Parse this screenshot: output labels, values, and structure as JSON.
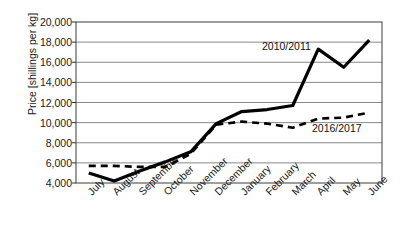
{
  "chart_data": {
    "type": "line",
    "title": "",
    "xlabel": "",
    "ylabel": "Price [shillings per kg]",
    "ylim": [
      4000,
      20000
    ],
    "ytick_values": [
      4000,
      6000,
      8000,
      10000,
      12000,
      14000,
      16000,
      18000,
      20000
    ],
    "ytick_labels": [
      "4,000",
      "6,000",
      "8,000",
      "10,000",
      "12,000",
      "14,000",
      "16,000",
      "18,000",
      "20,000"
    ],
    "grid": true,
    "legend_position": "inline-annotation",
    "categories": [
      "July",
      "August",
      "September",
      "October",
      "November",
      "December",
      "January",
      "February",
      "March",
      "April",
      "May",
      "June"
    ],
    "series": [
      {
        "name": "2010/2011",
        "style": "solid",
        "color": "#000000",
        "values": [
          5000,
          4200,
          5200,
          6100,
          7100,
          9900,
          11100,
          11300,
          11700,
          17300,
          15500,
          18200
        ]
      },
      {
        "name": "2016/2017",
        "style": "dashed",
        "color": "#000000",
        "values": [
          5700,
          5700,
          5600,
          5600,
          6900,
          9800,
          10100,
          9900,
          9500,
          10400,
          10500,
          11000
        ]
      }
    ],
    "annotations": [
      {
        "text": "2010/2011",
        "series": "2010/2011"
      },
      {
        "text": "2016/2017",
        "series": "2016/2017"
      }
    ]
  }
}
